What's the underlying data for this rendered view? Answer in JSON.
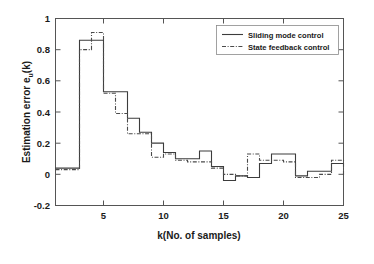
{
  "chart_data": {
    "type": "line",
    "title": "",
    "xlabel": "k(No. of samples)",
    "ylabel_main": "Estimation error e",
    "ylabel_sub": "u",
    "ylabel_tail": "(k)",
    "ylabel": "Estimation error e_u(k)",
    "xlim": [
      1,
      25
    ],
    "ylim": [
      -0.2,
      1
    ],
    "xticks": [
      5,
      10,
      15,
      20,
      25
    ],
    "xtick_labels": [
      "5",
      "10",
      "15",
      "20",
      "25"
    ],
    "yticks": [
      -0.2,
      0,
      0.2,
      0.4,
      0.6,
      0.8,
      1
    ],
    "ytick_labels": [
      "-0.2",
      "0",
      "0.2",
      "0.4",
      "0.6",
      "0.8",
      "1"
    ],
    "grid": false,
    "drawstyle": "steps-post",
    "legend_position": "upper right",
    "x": [
      1,
      2,
      3,
      4,
      5,
      6,
      7,
      8,
      9,
      10,
      11,
      12,
      13,
      14,
      15,
      16,
      17,
      18,
      19,
      20,
      21,
      22,
      23,
      24,
      25
    ],
    "series": [
      {
        "name": "Sliding mode control",
        "style": "solid",
        "color": "#3c3c3c",
        "values": [
          0.04,
          0.04,
          0.86,
          0.86,
          0.53,
          0.53,
          0.36,
          0.27,
          0.2,
          0.14,
          0.1,
          0.1,
          0.15,
          0.05,
          -0.04,
          -0.01,
          -0.02,
          0.07,
          0.13,
          0.13,
          -0.01,
          0.02,
          0.02,
          0.07,
          0.07
        ]
      },
      {
        "name": "State feedback control",
        "style": "dashdot",
        "color": "#4a4a4a",
        "values": [
          0.03,
          0.03,
          0.8,
          0.91,
          0.52,
          0.39,
          0.26,
          0.26,
          0.11,
          0.13,
          0.09,
          0.08,
          0.08,
          0.04,
          0.0,
          -0.01,
          0.13,
          0.09,
          0.09,
          0.08,
          -0.02,
          -0.02,
          0.0,
          0.09,
          -0.01
        ]
      }
    ]
  },
  "legend": {
    "entries": [
      {
        "label": "Sliding mode control",
        "style": "solid"
      },
      {
        "label": "State feedback control",
        "style": "dashdot"
      }
    ]
  }
}
